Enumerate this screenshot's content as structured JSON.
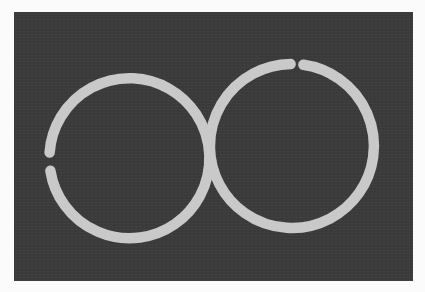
{
  "image": {
    "description": "Two light-gray rings on a dark gray background forming a figure-eight / infinity-like shape; each ring has a small gap",
    "background_color": "#fbfbfb",
    "panel_color": "#3b3b3b",
    "ring_color": "#c9c9c9",
    "rings": [
      {
        "name": "left-ring",
        "gap_position": "left side, slightly above center"
      },
      {
        "name": "right-ring",
        "gap_position": "top, slightly right of center"
      }
    ]
  }
}
